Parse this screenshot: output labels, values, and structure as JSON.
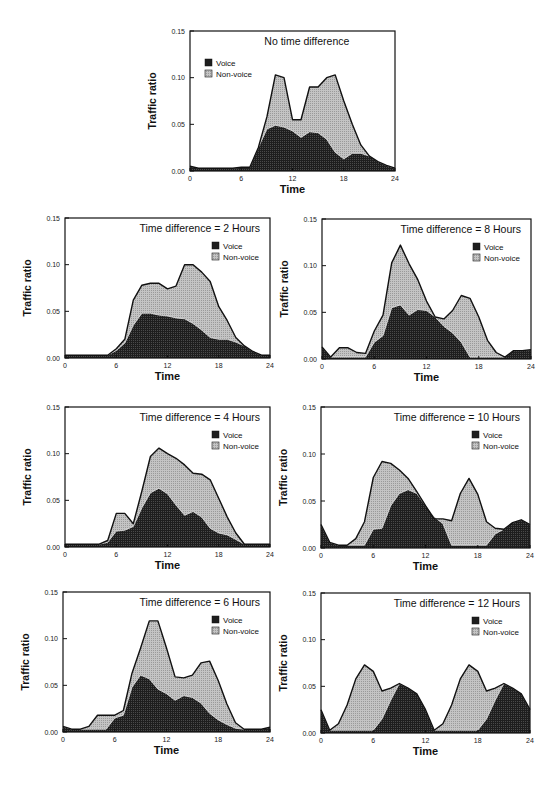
{
  "figure": {
    "ylabel": "Traffic  ratio",
    "xlabel": "Time",
    "legend": {
      "voice": "Voice",
      "nonvoice": "Non-voice"
    },
    "colors": {
      "voice": "#1e1e1e",
      "nonvoice": "#c4c4c4",
      "outline": "#111111"
    }
  },
  "chart_data": [
    {
      "id": "td0",
      "type": "area",
      "stacked": true,
      "title": "No time difference",
      "xlabel": "Time",
      "ylabel": "Traffic  ratio",
      "xlim": [
        0,
        24
      ],
      "ylim": [
        0,
        0.15
      ],
      "xticks": [
        0,
        6,
        12,
        18,
        24
      ],
      "yticks": [
        "0.00",
        "0.05",
        "0.10",
        "0.15"
      ],
      "legend_position": "upper-left",
      "x": [
        0,
        1,
        2,
        3,
        4,
        5,
        6,
        7,
        8,
        9,
        10,
        11,
        12,
        13,
        14,
        15,
        16,
        17,
        18,
        19,
        20,
        21,
        22,
        23,
        24
      ],
      "series": [
        {
          "name": "Voice",
          "values": [
            0.005,
            0.003,
            0.003,
            0.003,
            0.003,
            0.003,
            0.004,
            0.004,
            0.025,
            0.045,
            0.049,
            0.047,
            0.043,
            0.036,
            0.042,
            0.041,
            0.034,
            0.02,
            0.013,
            0.019,
            0.019,
            0.016,
            0.01,
            0.006,
            0.003
          ]
        },
        {
          "name": "Total (Voice + Non-voice)",
          "values": [
            0.005,
            0.003,
            0.003,
            0.003,
            0.003,
            0.003,
            0.004,
            0.004,
            0.025,
            0.058,
            0.103,
            0.1,
            0.055,
            0.055,
            0.09,
            0.09,
            0.1,
            0.103,
            0.075,
            0.05,
            0.028,
            0.016,
            0.01,
            0.006,
            0.003
          ]
        }
      ]
    },
    {
      "id": "td2",
      "type": "area",
      "stacked": true,
      "title": "Time difference = 2 Hours",
      "xlabel": "Time",
      "ylabel": "Traffic  ratio",
      "xlim": [
        0,
        24
      ],
      "ylim": [
        0,
        0.15
      ],
      "xticks": [
        0,
        6,
        12,
        18,
        24
      ],
      "yticks": [
        "0.00",
        "0.05",
        "0.10",
        "0.15"
      ],
      "legend_position": "upper-right",
      "x": [
        0,
        1,
        2,
        3,
        4,
        5,
        6,
        7,
        8,
        9,
        10,
        11,
        12,
        13,
        14,
        15,
        16,
        17,
        18,
        19,
        20,
        21,
        22,
        23,
        24
      ],
      "series": [
        {
          "name": "Voice",
          "values": [
            0.003,
            0.003,
            0.003,
            0.003,
            0.003,
            0.003,
            0.008,
            0.016,
            0.035,
            0.048,
            0.048,
            0.046,
            0.045,
            0.043,
            0.042,
            0.037,
            0.03,
            0.022,
            0.02,
            0.02,
            0.017,
            0.013,
            0.007,
            0.003,
            0.003
          ]
        },
        {
          "name": "Total (Voice + Non-voice)",
          "values": [
            0.003,
            0.003,
            0.003,
            0.003,
            0.003,
            0.003,
            0.01,
            0.02,
            0.062,
            0.078,
            0.08,
            0.08,
            0.074,
            0.077,
            0.1,
            0.1,
            0.092,
            0.082,
            0.055,
            0.04,
            0.022,
            0.013,
            0.007,
            0.003,
            0.003
          ]
        }
      ]
    },
    {
      "id": "td8",
      "type": "area",
      "stacked": true,
      "title": "Time difference = 8 Hours",
      "xlabel": "Time",
      "ylabel": "Traffic  ratio",
      "xlim": [
        0,
        24
      ],
      "ylim": [
        0,
        0.15
      ],
      "xticks": [
        0,
        6,
        12,
        18,
        24
      ],
      "yticks": [
        "0.00",
        "0.05",
        "0.10",
        "0.15"
      ],
      "legend_position": "upper-right",
      "x": [
        0,
        1,
        2,
        3,
        4,
        5,
        6,
        7,
        8,
        9,
        10,
        11,
        12,
        13,
        14,
        15,
        16,
        17,
        18,
        19,
        20,
        21,
        22,
        23,
        24
      ],
      "series": [
        {
          "name": "Voice",
          "values": [
            0.013,
            0.002,
            0.002,
            0.002,
            0.002,
            0.002,
            0.018,
            0.025,
            0.055,
            0.058,
            0.047,
            0.053,
            0.052,
            0.045,
            0.035,
            0.028,
            0.018,
            0.002,
            0.002,
            0.002,
            0.002,
            0.002,
            0.009,
            0.009,
            0.01
          ]
        },
        {
          "name": "Total (Voice + Non-voice)",
          "values": [
            0.013,
            0.002,
            0.012,
            0.012,
            0.007,
            0.006,
            0.03,
            0.047,
            0.103,
            0.122,
            0.102,
            0.085,
            0.062,
            0.045,
            0.043,
            0.052,
            0.068,
            0.065,
            0.045,
            0.02,
            0.007,
            0.002,
            0.009,
            0.009,
            0.01
          ]
        }
      ]
    },
    {
      "id": "td4",
      "type": "area",
      "stacked": true,
      "title": "Time difference = 4 Hours",
      "xlabel": "Time",
      "ylabel": "Traffic  ratio",
      "xlim": [
        0,
        24
      ],
      "ylim": [
        0,
        0.15
      ],
      "xticks": [
        0,
        6,
        12,
        18,
        24
      ],
      "yticks": [
        "0.00",
        "0.05",
        "0.10",
        "0.15"
      ],
      "legend_position": "upper-right",
      "x": [
        0,
        1,
        2,
        3,
        4,
        5,
        6,
        7,
        8,
        9,
        10,
        11,
        12,
        13,
        14,
        15,
        16,
        17,
        18,
        19,
        20,
        21,
        22,
        23,
        24
      ],
      "series": [
        {
          "name": "Voice",
          "values": [
            0.003,
            0.003,
            0.003,
            0.003,
            0.003,
            0.005,
            0.017,
            0.018,
            0.022,
            0.042,
            0.058,
            0.063,
            0.057,
            0.045,
            0.034,
            0.038,
            0.032,
            0.02,
            0.015,
            0.013,
            0.008,
            0.003,
            0.003,
            0.003,
            0.003
          ]
        },
        {
          "name": "Total (Voice + Non-voice)",
          "values": [
            0.003,
            0.003,
            0.003,
            0.003,
            0.003,
            0.007,
            0.036,
            0.036,
            0.025,
            0.06,
            0.097,
            0.106,
            0.1,
            0.095,
            0.088,
            0.079,
            0.078,
            0.072,
            0.052,
            0.032,
            0.015,
            0.003,
            0.003,
            0.003,
            0.003
          ]
        }
      ]
    },
    {
      "id": "td10",
      "type": "area",
      "stacked": true,
      "title": "Time difference = 10 Hours",
      "xlabel": "Time",
      "ylabel": "Traffic  ratio",
      "xlim": [
        0,
        24
      ],
      "ylim": [
        0,
        0.15
      ],
      "xticks": [
        0,
        6,
        12,
        18,
        24
      ],
      "yticks": [
        "0.00",
        "0.05",
        "0.10",
        "0.15"
      ],
      "legend_position": "upper-right",
      "x": [
        0,
        1,
        2,
        3,
        4,
        5,
        6,
        7,
        8,
        9,
        10,
        11,
        12,
        13,
        14,
        15,
        16,
        17,
        18,
        19,
        20,
        21,
        22,
        23,
        24
      ],
      "series": [
        {
          "name": "Voice",
          "values": [
            0.025,
            0.006,
            0.003,
            0.003,
            0.003,
            0.003,
            0.02,
            0.021,
            0.045,
            0.058,
            0.062,
            0.058,
            0.045,
            0.033,
            0.026,
            0.003,
            0.003,
            0.003,
            0.003,
            0.003,
            0.015,
            0.02,
            0.027,
            0.03,
            0.025
          ]
        },
        {
          "name": "Total (Voice + Non-voice)",
          "values": [
            0.025,
            0.006,
            0.003,
            0.003,
            0.01,
            0.028,
            0.075,
            0.092,
            0.09,
            0.083,
            0.074,
            0.06,
            0.045,
            0.031,
            0.031,
            0.029,
            0.058,
            0.074,
            0.057,
            0.028,
            0.021,
            0.02,
            0.027,
            0.03,
            0.025
          ]
        }
      ]
    },
    {
      "id": "td6",
      "type": "area",
      "stacked": true,
      "title": "Time difference = 6 Hours",
      "xlabel": "Time",
      "ylabel": "Traffic  ratio",
      "xlim": [
        0,
        24
      ],
      "ylim": [
        0,
        0.15
      ],
      "xticks": [
        0,
        6,
        12,
        18,
        24
      ],
      "yticks": [
        "0.00",
        "0.05",
        "0.10",
        "0.15"
      ],
      "legend_position": "upper-right",
      "x": [
        0,
        1,
        2,
        3,
        4,
        5,
        6,
        7,
        8,
        9,
        10,
        11,
        12,
        13,
        14,
        15,
        16,
        17,
        18,
        19,
        20,
        21,
        22,
        23,
        24
      ],
      "series": [
        {
          "name": "Voice",
          "values": [
            0.006,
            0.003,
            0.003,
            0.003,
            0.003,
            0.003,
            0.015,
            0.018,
            0.048,
            0.061,
            0.057,
            0.046,
            0.041,
            0.034,
            0.039,
            0.037,
            0.031,
            0.02,
            0.013,
            0.008,
            0.004,
            0.003,
            0.003,
            0.003,
            0.005
          ]
        },
        {
          "name": "Total (Voice + Non-voice)",
          "values": [
            0.006,
            0.003,
            0.003,
            0.006,
            0.018,
            0.018,
            0.018,
            0.023,
            0.063,
            0.09,
            0.119,
            0.119,
            0.09,
            0.059,
            0.058,
            0.061,
            0.074,
            0.076,
            0.055,
            0.03,
            0.01,
            0.003,
            0.003,
            0.003,
            0.005
          ]
        }
      ]
    },
    {
      "id": "td12",
      "type": "area",
      "stacked": true,
      "title": "Time difference = 12 Hours",
      "xlabel": "Time",
      "ylabel": "Traffic  ratio",
      "xlim": [
        0,
        24
      ],
      "ylim": [
        0,
        0.15
      ],
      "xticks": [
        0,
        6,
        12,
        18,
        24
      ],
      "yticks": [
        "0.00",
        "0.05",
        "0.10",
        "0.15"
      ],
      "legend_position": "upper-right",
      "x": [
        0,
        1,
        2,
        3,
        4,
        5,
        6,
        7,
        8,
        9,
        10,
        11,
        12,
        13,
        14,
        15,
        16,
        17,
        18,
        19,
        20,
        21,
        22,
        23,
        24
      ],
      "series": [
        {
          "name": "Voice",
          "values": [
            0.025,
            0.003,
            0.003,
            0.003,
            0.003,
            0.003,
            0.003,
            0.015,
            0.035,
            0.053,
            0.048,
            0.042,
            0.025,
            0.003,
            0.003,
            0.003,
            0.003,
            0.003,
            0.003,
            0.015,
            0.035,
            0.053,
            0.048,
            0.042,
            0.025
          ]
        },
        {
          "name": "Total (Voice + Non-voice)",
          "values": [
            0.025,
            0.003,
            0.01,
            0.03,
            0.058,
            0.073,
            0.066,
            0.045,
            0.048,
            0.053,
            0.048,
            0.042,
            0.025,
            0.003,
            0.01,
            0.03,
            0.058,
            0.073,
            0.066,
            0.045,
            0.048,
            0.053,
            0.048,
            0.042,
            0.025
          ]
        }
      ]
    }
  ]
}
